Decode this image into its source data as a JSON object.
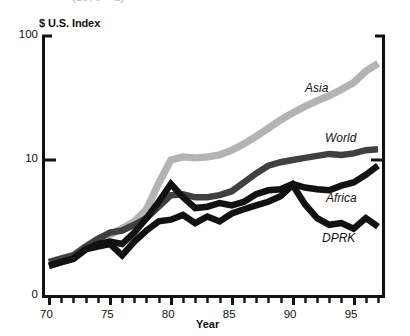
{
  "figure": {
    "cropped_title": "(1970 = 1)",
    "y_axis_title": "$ U.S. Index",
    "x_axis_title": "Year"
  },
  "chart_data": {
    "type": "line",
    "title": "(1970 = 1)",
    "xlabel": "Year",
    "ylabel": "$ U.S. Index",
    "yscale": "log",
    "ylim": [
      1,
      100
    ],
    "xlim": [
      70,
      97
    ],
    "grid": false,
    "legend_position": "inline-right",
    "y_tick_labels": [
      "100",
      "10",
      "0"
    ],
    "y_tick_values": [
      100,
      10,
      0
    ],
    "x_tick_labels": [
      "70",
      "75",
      "80",
      "85",
      "90",
      "95"
    ],
    "x_tick_values": [
      70,
      75,
      80,
      85,
      90,
      95
    ],
    "x_minor_ticks_every": 1,
    "x": [
      70,
      71,
      72,
      73,
      74,
      75,
      76,
      77,
      78,
      79,
      80,
      81,
      82,
      83,
      84,
      85,
      86,
      87,
      88,
      89,
      90,
      91,
      92,
      93,
      94,
      95,
      96,
      97
    ],
    "series": [
      {
        "name": "Asia",
        "color": "#b3b3b3",
        "label_x": 97,
        "values": [
          1.5,
          1.6,
          1.7,
          2.0,
          2.3,
          2.5,
          2.8,
          3.2,
          4.0,
          6.5,
          10.0,
          10.6,
          10.4,
          10.6,
          11.0,
          12.0,
          13.5,
          15.5,
          18.0,
          21.0,
          24.0,
          27.0,
          30.0,
          33.0,
          37.0,
          42.0,
          52.0,
          60.0
        ]
      },
      {
        "name": "World",
        "color": "#404040",
        "label_x": 97,
        "values": [
          1.5,
          1.6,
          1.7,
          2.0,
          2.3,
          2.6,
          2.7,
          3.0,
          3.4,
          4.2,
          5.2,
          5.3,
          5.0,
          5.0,
          5.2,
          5.6,
          6.6,
          7.8,
          9.0,
          9.6,
          10.0,
          10.4,
          10.8,
          11.2,
          11.0,
          11.3,
          12.0,
          12.2
        ]
      },
      {
        "name": "Africa",
        "color": "#111111",
        "label_x": 97,
        "values": [
          1.4,
          1.5,
          1.6,
          1.9,
          2.1,
          2.2,
          2.1,
          2.6,
          3.4,
          4.6,
          6.4,
          5.0,
          4.1,
          4.2,
          4.5,
          4.3,
          4.6,
          5.3,
          5.7,
          5.8,
          6.4,
          6.0,
          5.8,
          5.7,
          6.2,
          6.6,
          7.6,
          9.0
        ]
      },
      {
        "name": "DPRK",
        "color": "#111111",
        "label_x": 97,
        "values": [
          1.4,
          1.5,
          1.6,
          1.9,
          2.0,
          2.1,
          1.7,
          2.2,
          2.7,
          3.2,
          3.3,
          3.6,
          3.1,
          3.5,
          3.2,
          3.7,
          4.0,
          4.3,
          4.6,
          5.1,
          6.3,
          4.4,
          3.4,
          3.0,
          3.1,
          2.8,
          3.4,
          2.9
        ]
      }
    ]
  }
}
